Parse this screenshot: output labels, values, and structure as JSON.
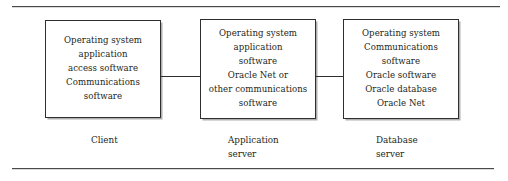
{
  "figure": {
    "type": "block-diagram",
    "rules": {
      "top_label": "top-horizontal-rule",
      "bottom_label": "bottom-horizontal-rule"
    },
    "colors": {
      "stroke": "#2f2f2f",
      "text": "#231f20",
      "background": "#ffffff",
      "rule": "#4a4a4a"
    },
    "nodes": [
      {
        "id": "client",
        "body": "Operating system\napplication\naccess software\nCommunications\nsoftware",
        "caption": "Client"
      },
      {
        "id": "application-server",
        "body": "Operating system\napplication\nsoftware\nOracle Net or\nother communications\nsoftware",
        "caption": "Application\nserver"
      },
      {
        "id": "database-server",
        "body": "Operating system\nCommunications\nsoftware\nOracle software\nOracle database\nOracle Net",
        "caption": "Database\nserver"
      }
    ],
    "connectors": [
      {
        "id": "client-to-application-server",
        "from": "client",
        "to": "application-server"
      },
      {
        "id": "application-server-to-database-server",
        "from": "application-server",
        "to": "database-server"
      }
    ]
  }
}
